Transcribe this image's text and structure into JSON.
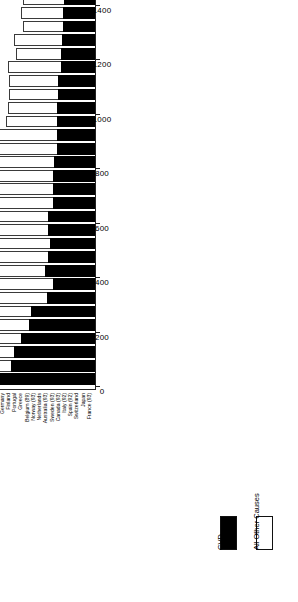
{
  "chart_data": {
    "type": "bar",
    "subtype": "stacked-horizontal",
    "title": "",
    "xlabel": "Country",
    "ylabel": "",
    "ylim": [
      0,
      1800
    ],
    "ticks": [
      0,
      200,
      400,
      600,
      800,
      1000,
      1200,
      1400,
      1600,
      1800
    ],
    "grid": false,
    "legend_position": "bottom-right",
    "orientation": "rotated-90",
    "categories": [
      "Russian Federation",
      "Romania (92)",
      "Bulgaria",
      "Hungary",
      "Czech Republic (93)",
      "Poland",
      "Columbia (91)",
      "China - Urban",
      "Scotland",
      "China - Rural",
      "Argentina (91)",
      "Northern Ireland",
      "Ireland (91)",
      "New Zealand",
      "Israel (93)",
      "UNITED STATES (93)",
      "England/Wales",
      "Denmark (93)‡",
      "Mexico (93)",
      "Austria",
      "Puerto Rico (92)",
      "Germany",
      "Finland",
      "Portugal",
      "Greece",
      "Belgium (89)",
      "Norway (93)",
      "Netherlands",
      "Australia (93)",
      "Sweden (93)",
      "Canada (93)",
      "Italy (92)",
      "Spain (92)",
      "Switzerland",
      "Japan",
      "France (93)"
    ],
    "series": [
      {
        "name": "CVD",
        "color": "#000000",
        "values": [
          820,
          660,
          640,
          580,
          520,
          500,
          380,
          330,
          390,
          370,
          350,
          370,
          370,
          330,
          330,
          330,
          320,
          300,
          300,
          300,
          300,
          290,
          290,
          270,
          270,
          260,
          250,
          250,
          240,
          240,
          230,
          210,
          210,
          195,
          190,
          165
        ]
      },
      {
        "name": "All Other Causes",
        "color": "#ffffff",
        "values": [
          745,
          590,
          565,
          750,
          450,
          440,
          590,
          520,
          415,
          550,
          640,
          430,
          420,
          465,
          430,
          495,
          440,
          510,
          540,
          400,
          385,
          385,
          390,
          415,
          355,
          380,
          320,
          330,
          330,
          305,
          330,
          340,
          345,
          325,
          250,
          390
        ]
      }
    ],
    "totals": [
      1565,
      1250,
      1205,
      1330,
      970,
      940,
      970,
      850,
      805,
      920,
      990,
      800,
      790,
      795,
      760,
      825,
      760,
      810,
      840,
      700,
      685,
      675,
      680,
      685,
      625,
      640,
      570,
      580,
      570,
      545,
      560,
      550,
      555,
      520,
      440,
      555
    ]
  },
  "legend": {
    "items": [
      {
        "label": "CVD",
        "swatch": "black-filled"
      },
      {
        "label": "All Other Causes",
        "swatch": "white-outlined"
      }
    ]
  },
  "axis": {
    "category_title": "Country"
  }
}
